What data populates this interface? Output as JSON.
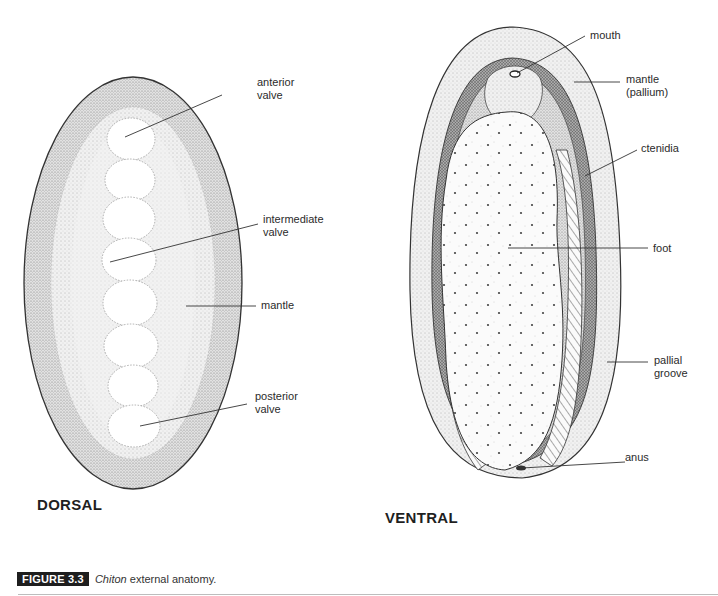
{
  "figure": {
    "badge": "FIGURE 3.3",
    "caption_italic": "Chiton",
    "caption_rest": " external anatomy."
  },
  "dorsal": {
    "title": "DORSAL",
    "labels": {
      "anterior_valve": "anterior\nvalve",
      "intermediate_valve": "intermediate\nvalve",
      "mantle": "mantle",
      "posterior_valve": "posterior\nvalve"
    },
    "valve_count": 8
  },
  "ventral": {
    "title": "VENTRAL",
    "labels": {
      "mouth": "mouth",
      "mantle": "mantle\n(pallium)",
      "ctenidia": "ctenidia",
      "foot": "foot",
      "pallial_groove": "pallial\ngroove",
      "anus": "anus"
    }
  },
  "colors": {
    "ink": "#2a2a2a",
    "stipple_light": "#e4e4e4",
    "stipple_mid": "#cfcfcf",
    "stipple_dark": "#8d8d8d",
    "badge_bg": "#1e1e1e"
  }
}
